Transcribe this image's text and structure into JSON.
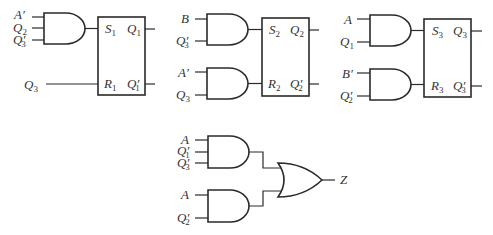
{
  "diagram": {
    "flipflops": [
      {
        "name": "FF1",
        "set": {
          "base": "S",
          "sub": "1"
        },
        "reset": {
          "base": "R",
          "sub": "1"
        },
        "q": {
          "base": "Q",
          "sub": "1",
          "prime": ""
        },
        "qn": {
          "base": "Q",
          "sub": "1",
          "prime": "′"
        }
      },
      {
        "name": "FF2",
        "set": {
          "base": "S",
          "sub": "2"
        },
        "reset": {
          "base": "R",
          "sub": "2"
        },
        "q": {
          "base": "Q",
          "sub": "2",
          "prime": ""
        },
        "qn": {
          "base": "Q",
          "sub": "2",
          "prime": "′"
        }
      },
      {
        "name": "FF3",
        "set": {
          "base": "S",
          "sub": "3"
        },
        "reset": {
          "base": "R",
          "sub": "3"
        },
        "q": {
          "base": "Q",
          "sub": "3",
          "prime": ""
        },
        "qn": {
          "base": "Q",
          "sub": "3",
          "prime": "′"
        }
      }
    ],
    "gates": {
      "g1": {
        "type": "AND",
        "inputs": [
          {
            "base": "A",
            "sub": "",
            "prime": "′"
          },
          {
            "base": "Q",
            "sub": "2",
            "prime": ""
          },
          {
            "base": "Q",
            "sub": "3",
            "prime": "′"
          }
        ],
        "drives": "S1"
      },
      "r1_input": {
        "base": "Q",
        "sub": "3",
        "prime": "",
        "drives": "R1"
      },
      "g2a": {
        "type": "AND",
        "inputs": [
          {
            "base": "B",
            "sub": "",
            "prime": ""
          },
          {
            "base": "Q",
            "sub": "3",
            "prime": "′"
          }
        ],
        "drives": "S2"
      },
      "g2b": {
        "type": "AND",
        "inputs": [
          {
            "base": "A",
            "sub": "",
            "prime": "′"
          },
          {
            "base": "Q",
            "sub": "3",
            "prime": ""
          }
        ],
        "drives": "R2"
      },
      "g3a": {
        "type": "AND",
        "inputs": [
          {
            "base": "A",
            "sub": "",
            "prime": ""
          },
          {
            "base": "Q",
            "sub": "1",
            "prime": ""
          }
        ],
        "drives": "S3"
      },
      "g3b": {
        "type": "AND",
        "inputs": [
          {
            "base": "B",
            "sub": "",
            "prime": "′"
          },
          {
            "base": "Q",
            "sub": "2",
            "prime": "′"
          }
        ],
        "drives": "R3"
      },
      "g4a": {
        "type": "AND",
        "inputs": [
          {
            "base": "A",
            "sub": "",
            "prime": ""
          },
          {
            "base": "Q",
            "sub": "1",
            "prime": "′"
          },
          {
            "base": "Q",
            "sub": "3",
            "prime": "′"
          }
        ],
        "drives": "OR"
      },
      "g4b": {
        "type": "AND",
        "inputs": [
          {
            "base": "A",
            "sub": "",
            "prime": ""
          },
          {
            "base": "Q",
            "sub": "2",
            "prime": "′"
          }
        ],
        "drives": "OR"
      },
      "or": {
        "type": "OR",
        "output": "Z"
      }
    }
  }
}
